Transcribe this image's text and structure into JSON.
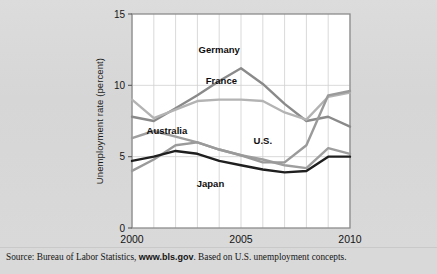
{
  "figure": {
    "source_prefix": "Source: Bureau of Labor Statistics, ",
    "source_link": "www.bls.gov",
    "source_suffix": ". Based on U.S. unemployment concepts."
  },
  "chart_data": {
    "type": "line",
    "title": "",
    "xlabel": "",
    "ylabel": "Unemployment rate (percent)",
    "xlim": [
      2000,
      2010
    ],
    "ylim": [
      0,
      15
    ],
    "yticks": [
      0,
      5,
      10,
      15
    ],
    "ytick_labels": [
      "0",
      "5",
      "10",
      "15"
    ],
    "xticks": [
      2000,
      2005,
      2010
    ],
    "xtick_labels": [
      "2000",
      "2005",
      "2010"
    ],
    "grid": "vertical gridlines at every year; horizontal gridlines at 5 and 10",
    "legend": "inline data labels on plot",
    "x": [
      2000,
      2001,
      2002,
      2003,
      2004,
      2005,
      2006,
      2007,
      2008,
      2009,
      2010
    ],
    "series": [
      {
        "name": "Germany",
        "color": "#8a8a8a",
        "values": [
          7.8,
          7.5,
          8.4,
          9.3,
          10.3,
          11.2,
          10.1,
          8.7,
          7.5,
          7.8,
          7.1
        ],
        "label_x": 2004.0,
        "label_y": 12.3
      },
      {
        "name": "France",
        "color": "#b3b3b3",
        "values": [
          9.0,
          7.7,
          8.3,
          8.9,
          9.0,
          9.0,
          8.9,
          8.1,
          7.6,
          9.2,
          9.5
        ],
        "label_x": 2004.1,
        "label_y": 10.1
      },
      {
        "name": "Australia",
        "color": "#9e9e9e",
        "values": [
          6.3,
          6.8,
          6.4,
          6.0,
          5.5,
          5.1,
          4.8,
          4.4,
          4.2,
          5.6,
          5.2
        ],
        "label_x": 2001.6,
        "label_y": 6.6
      },
      {
        "name": "U.S.",
        "color": "#9a9a9a",
        "values": [
          4.0,
          4.8,
          5.8,
          6.0,
          5.5,
          5.1,
          4.6,
          4.6,
          5.8,
          9.3,
          9.6
        ],
        "label_x": 2006.0,
        "label_y": 5.9
      },
      {
        "name": "Japan",
        "color": "#1f1f1f",
        "values": [
          4.7,
          5.0,
          5.4,
          5.2,
          4.7,
          4.4,
          4.1,
          3.9,
          4.0,
          5.0,
          5.0
        ],
        "label_x": 2003.6,
        "label_y": 2.9
      }
    ]
  }
}
